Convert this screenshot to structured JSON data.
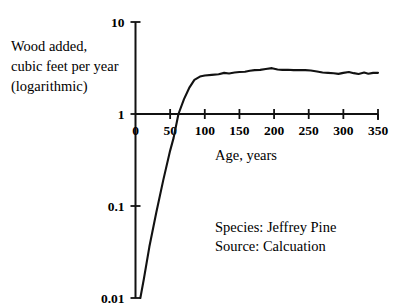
{
  "chart_data": {
    "type": "line",
    "title": "",
    "xlabel": "Age, years",
    "ylabel": "Wood added, cubic feet per year (logarithmic)",
    "ylabel_lines": [
      "Wood added,",
      "cubic feet per year",
      "(logarithmic)"
    ],
    "yscale": "log",
    "xlim": [
      0,
      350
    ],
    "ylim": [
      0.01,
      10
    ],
    "grid": false,
    "legend": false,
    "x_ticks": [
      0,
      50,
      100,
      150,
      200,
      250,
      300,
      350
    ],
    "x_tick_labels": [
      "0",
      "50",
      "100",
      "150",
      "200",
      "250",
      "300",
      "350"
    ],
    "y_ticks": [
      0.01,
      0.1,
      1,
      10
    ],
    "y_tick_labels": [
      "0.01",
      "0.1",
      "1",
      "10"
    ],
    "series": [
      {
        "name": "Wood added",
        "x": [
          7,
          12,
          20,
          30,
          40,
          50,
          55,
          62,
          70,
          78,
          85,
          93,
          100,
          110,
          120,
          128,
          135,
          143,
          150,
          158,
          165,
          172,
          180,
          188,
          197,
          205,
          212,
          220,
          228,
          236,
          245,
          253,
          262,
          270,
          278,
          286,
          293,
          300,
          308,
          315,
          322,
          330,
          336,
          343,
          350
        ],
        "y": [
          0.01,
          0.016,
          0.036,
          0.085,
          0.19,
          0.4,
          0.55,
          1.0,
          1.45,
          1.95,
          2.35,
          2.55,
          2.62,
          2.66,
          2.7,
          2.8,
          2.76,
          2.82,
          2.86,
          2.88,
          2.95,
          3.0,
          3.02,
          3.08,
          3.15,
          3.05,
          3.02,
          3.03,
          3.0,
          3.0,
          3.0,
          2.97,
          2.9,
          2.83,
          2.8,
          2.77,
          2.73,
          2.8,
          2.86,
          2.78,
          2.72,
          2.82,
          2.74,
          2.8,
          2.8
        ]
      }
    ],
    "annotations": [
      "Species: Jeffrey Pine",
      "Source: Calcuation"
    ]
  },
  "annotations": {
    "species_line": "Species: Jeffrey Pine",
    "source_line": "Source: Calcuation"
  },
  "axes": {
    "x_title": "Age, years",
    "y_title_line1": "Wood added,",
    "y_title_line2": "cubic feet per year",
    "y_title_line3": "(logarithmic)"
  },
  "ticks": {
    "x": [
      "0",
      "50",
      "100",
      "150",
      "200",
      "250",
      "300",
      "350"
    ],
    "y": [
      "10",
      "1",
      "0.1",
      "0.01"
    ]
  },
  "colors": {
    "curve": "#121212",
    "axis": "#111111",
    "text": "#000000",
    "background": "#ffffff"
  }
}
